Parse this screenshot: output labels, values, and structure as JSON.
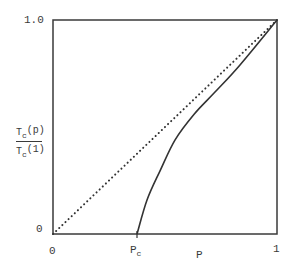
{
  "chart_data": {
    "type": "line",
    "title": "",
    "xlabel": "P",
    "ylabel": "Tc(p) / Tc(1)",
    "ylabel_parts": {
      "numerator": "T",
      "numerator_sub": "c",
      "numerator_arg": "(p)",
      "denominator": "T",
      "denominator_sub": "c",
      "denominator_arg": "(1)"
    },
    "xlim": [
      0,
      1
    ],
    "ylim": [
      0,
      1.0
    ],
    "x_ticks": [
      {
        "value": 0,
        "label": "0"
      },
      {
        "value": 0.375,
        "label": "P",
        "label_sub": "c"
      },
      {
        "value": 1,
        "label": "1"
      }
    ],
    "y_ticks": [
      {
        "value": 0,
        "label": "0"
      },
      {
        "value": 1.0,
        "label": "1.0"
      }
    ],
    "grid": false,
    "legend": null,
    "series": [
      {
        "name": "Tc(p)/Tc(1)",
        "style": "solid",
        "x": [
          0.375,
          0.42,
          0.48,
          0.545,
          0.63,
          0.72,
          0.835,
          1.0
        ],
        "y": [
          0.0,
          0.16,
          0.3,
          0.44,
          0.56,
          0.66,
          0.79,
          1.0
        ]
      },
      {
        "name": "reference diagonal",
        "style": "dotted",
        "x": [
          0,
          1
        ],
        "y": [
          0,
          1
        ]
      }
    ],
    "colors": {
      "axis": "#3a3a3a",
      "curve": "#333333",
      "diagonal": "#333333"
    }
  },
  "labels": {
    "y_top": "1.0",
    "y_bottom": "0",
    "x_left": "0",
    "x_pc": "P",
    "x_pc_sub": "c",
    "x_right": "1",
    "x_axis_title": "P",
    "y_num": "T",
    "y_num_sub": "c",
    "y_num_arg": "(p)",
    "y_den": "T",
    "y_den_sub": "c",
    "y_den_arg": "(1)"
  }
}
